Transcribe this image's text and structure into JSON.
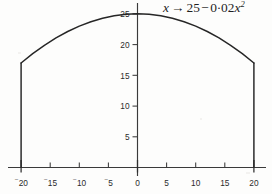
{
  "figure": {
    "title_plain": "x → 25 − 0·02x²",
    "title_parts": {
      "variable": "x",
      "arrow": "→",
      "constant": "25",
      "minus": "−",
      "coef_int": "0",
      "coef_dot": "·",
      "coef_frac": "02",
      "term_var": "x",
      "term_exp": "2"
    },
    "background_color": "#fdfdfc",
    "ink_color": "#262626",
    "axis_color": "#3a3a3a"
  },
  "chart_data": {
    "type": "line",
    "xlabel": "",
    "ylabel": "",
    "xlim": [
      -21.5,
      22.5
    ],
    "ylim": [
      0,
      27
    ],
    "grid": false,
    "legend": null,
    "equation": "y = 25 - 0.02*x^2",
    "x_ticks": [
      -20,
      -15,
      -10,
      -5,
      0,
      5,
      10,
      15,
      20
    ],
    "x_tick_labels": [
      "⁻20",
      "⁻15",
      "⁻10",
      "⁻5",
      "0",
      "5",
      "10",
      "15",
      "20"
    ],
    "x_major_ticks": [
      -20,
      0,
      20
    ],
    "y_ticks": [
      5,
      10,
      15,
      20,
      25
    ],
    "y_tick_labels": [
      "5",
      "10",
      "15",
      "20",
      "25"
    ],
    "series": [
      {
        "name": "parabolic arch",
        "kind": "curve",
        "x": [
          -20,
          -18,
          -16,
          -14,
          -12,
          -10,
          -8,
          -6,
          -4,
          -2,
          0,
          2,
          4,
          6,
          8,
          10,
          12,
          14,
          16,
          18,
          20
        ],
        "values": [
          17,
          18.52,
          19.88,
          21.08,
          22.12,
          23,
          23.72,
          24.28,
          24.68,
          24.92,
          25,
          24.92,
          24.68,
          24.28,
          23.72,
          23,
          22.12,
          21.08,
          19.88,
          18.52,
          17
        ]
      },
      {
        "name": "left vertical leg",
        "kind": "segment",
        "x": [
          -20,
          -20
        ],
        "values": [
          17,
          0
        ]
      },
      {
        "name": "right vertical leg",
        "kind": "segment",
        "x": [
          20,
          20
        ],
        "values": [
          17,
          0
        ]
      }
    ],
    "annotations": [
      {
        "text": "25",
        "x": 0,
        "y": 25,
        "role": "apex-value"
      },
      {
        "text": "17",
        "x": -20,
        "y": 17,
        "role": "shoulder-value"
      },
      {
        "text": "17",
        "x": 20,
        "y": 17,
        "role": "shoulder-value"
      }
    ]
  }
}
